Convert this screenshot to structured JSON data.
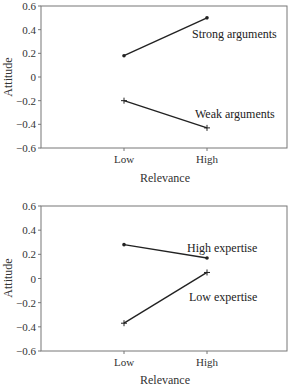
{
  "chart_data": [
    {
      "type": "line",
      "title": "",
      "xlabel": "Relevance",
      "ylabel": "Attitude",
      "categories": [
        "Low",
        "High"
      ],
      "ylim": [
        -0.6,
        0.6
      ],
      "yticks": [
        "0.6",
        "0.4",
        "0.2",
        "0",
        "−0.2",
        "−0.4",
        "−0.6"
      ],
      "grid": false,
      "legend": "inline labels",
      "series": [
        {
          "name": "Strong arguments",
          "marker": "dot",
          "values": [
            0.18,
            0.5
          ]
        },
        {
          "name": "Weak arguments",
          "marker": "plus",
          "values": [
            -0.2,
            -0.43
          ]
        }
      ]
    },
    {
      "type": "line",
      "title": "",
      "xlabel": "Relevance",
      "ylabel": "Attitude",
      "categories": [
        "Low",
        "High"
      ],
      "ylim": [
        -0.6,
        0.6
      ],
      "yticks": [
        "0.6",
        "0.4",
        "0.2",
        "0",
        "−0.2",
        "−0.4",
        "−0.6"
      ],
      "grid": false,
      "legend": "inline labels",
      "series": [
        {
          "name": "High expertise",
          "marker": "dot",
          "values": [
            0.28,
            0.17
          ]
        },
        {
          "name": "Low expertise",
          "marker": "plus",
          "values": [
            -0.37,
            0.05
          ]
        }
      ]
    }
  ]
}
